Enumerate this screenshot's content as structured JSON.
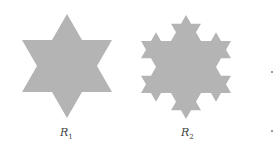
{
  "figure": {
    "fill_color": "#b4b4b4",
    "shapes": [
      {
        "id": "R1",
        "label_main": "R",
        "label_sub": "1",
        "center": [
          67,
          66
        ],
        "radius": 52,
        "iterations": 1
      },
      {
        "id": "R2",
        "label_main": "R",
        "label_sub": "2",
        "center": [
          186,
          67
        ],
        "radius": 52,
        "iterations": 2
      }
    ],
    "margin_dots": [
      [
        272,
        72
      ],
      [
        272,
        131
      ]
    ]
  }
}
